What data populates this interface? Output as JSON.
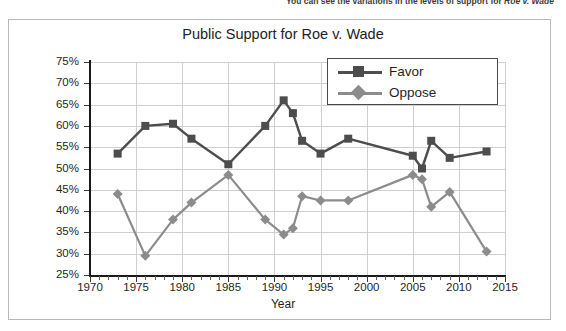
{
  "page": {
    "body_text_clipped": "You can see the variations in the levels of support for Roe v. Wade",
    "body_text_italic_part": "Roe v. Wade"
  },
  "chart_data": {
    "type": "line",
    "title": "Public Support for Roe v. Wade",
    "xlabel": "Year",
    "ylabel": "",
    "xlim": [
      1970,
      2015
    ],
    "ylim": [
      25,
      75
    ],
    "xticks": [
      1970,
      1975,
      1980,
      1985,
      1990,
      1995,
      2000,
      2005,
      2010,
      2015
    ],
    "xtick_labels": [
      "1970",
      "1975",
      "1980",
      "1985",
      "1990",
      "1995",
      "2000",
      "2005",
      "2010",
      "2015"
    ],
    "yticks": [
      25,
      30,
      35,
      40,
      45,
      50,
      55,
      60,
      65,
      70,
      75
    ],
    "ytick_labels": [
      "25%",
      "30%",
      "35%",
      "40%",
      "45%",
      "50%",
      "55%",
      "60%",
      "65%",
      "70%",
      "75%"
    ],
    "grid": true,
    "legend_position": "top-right",
    "series": [
      {
        "name": "Favor",
        "color": "#4d4d4d",
        "marker": "square",
        "points": [
          {
            "x": 1973,
            "y": 53.5
          },
          {
            "x": 1976,
            "y": 60.0
          },
          {
            "x": 1979,
            "y": 60.5
          },
          {
            "x": 1981,
            "y": 57.0
          },
          {
            "x": 1985,
            "y": 51.0
          },
          {
            "x": 1989,
            "y": 60.0
          },
          {
            "x": 1991,
            "y": 66.0
          },
          {
            "x": 1992,
            "y": 63.0
          },
          {
            "x": 1993,
            "y": 56.5
          },
          {
            "x": 1995,
            "y": 53.5
          },
          {
            "x": 1998,
            "y": 57.0
          },
          {
            "x": 2005,
            "y": 53.0
          },
          {
            "x": 2006,
            "y": 50.0
          },
          {
            "x": 2007,
            "y": 56.5
          },
          {
            "x": 2009,
            "y": 52.5
          },
          {
            "x": 2013,
            "y": 54.0
          }
        ]
      },
      {
        "name": "Oppose",
        "color": "#8c8c8c",
        "marker": "diamond",
        "points": [
          {
            "x": 1973,
            "y": 44.0
          },
          {
            "x": 1976,
            "y": 29.5
          },
          {
            "x": 1979,
            "y": 38.0
          },
          {
            "x": 1981,
            "y": 42.0
          },
          {
            "x": 1985,
            "y": 48.5
          },
          {
            "x": 1989,
            "y": 38.0
          },
          {
            "x": 1991,
            "y": 34.5
          },
          {
            "x": 1992,
            "y": 36.0
          },
          {
            "x": 1993,
            "y": 43.5
          },
          {
            "x": 1995,
            "y": 42.5
          },
          {
            "x": 1998,
            "y": 42.5
          },
          {
            "x": 2005,
            "y": 48.5
          },
          {
            "x": 2006,
            "y": 47.5
          },
          {
            "x": 2007,
            "y": 41.0
          },
          {
            "x": 2009,
            "y": 44.5
          },
          {
            "x": 2013,
            "y": 30.5
          }
        ]
      }
    ]
  }
}
